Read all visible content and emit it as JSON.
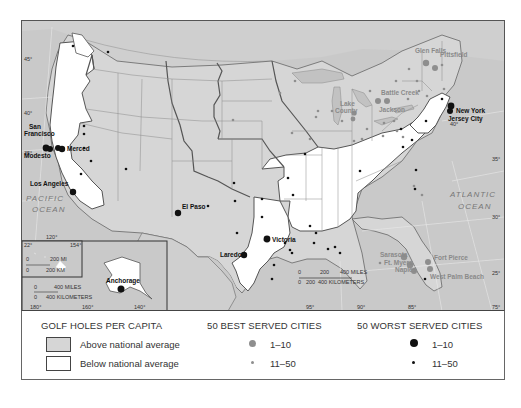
{
  "map": {
    "colors": {
      "above_average": "#d6d6d6",
      "below_average": "#ffffff",
      "water": "#c9c9c9",
      "best_dot": "#8e8e8e",
      "worst_dot": "#111111"
    },
    "oceans": {
      "pacific_line1": "PACIFIC",
      "pacific_line2": "OCEAN",
      "atlantic_line1": "ATLANTIC",
      "atlantic_line2": "OCEAN"
    },
    "latitude_ticks": [
      "45°",
      "40°",
      "35°",
      "30°",
      "25°"
    ],
    "east_latitude_ticks": [
      "40°",
      "35°",
      "30°",
      "25°"
    ],
    "longitude_ticks": [
      "95°",
      "90°",
      "85°",
      "75°"
    ],
    "inset_longitude_ticks": [
      "180°",
      "160°",
      "140°"
    ],
    "hawaii_ticks": [
      "22°",
      "154°",
      "120°"
    ],
    "scale_main": {
      "miles": [
        "0",
        "200",
        "400 MILES"
      ],
      "km": [
        "0",
        "200",
        "400 KILOMETERS"
      ]
    },
    "scale_hawaii": {
      "miles": [
        "0",
        "200 MI"
      ],
      "km": [
        "0",
        "200 KM"
      ]
    },
    "scale_alaska": {
      "miles": [
        "0",
        "400 MILES"
      ],
      "km": [
        "0",
        "400 KILOMETERS"
      ]
    },
    "cities_worst_top10": [
      {
        "name": "San Francisco",
        "line1": "San",
        "line2": "Francisco"
      },
      {
        "name": "Modesto"
      },
      {
        "name": "Merced"
      },
      {
        "name": "Los Angeles"
      },
      {
        "name": "El Paso"
      },
      {
        "name": "Laredo"
      },
      {
        "name": "Victoria"
      },
      {
        "name": "Anchorage"
      },
      {
        "name": "New York"
      },
      {
        "name": "Jersey City"
      }
    ],
    "cities_best_top10": [
      {
        "name": "Glen Falls"
      },
      {
        "name": "Pittsfield"
      },
      {
        "name": "Battle Creek"
      },
      {
        "name": "Lake County",
        "line1": "Lake",
        "line2": "County"
      },
      {
        "name": "Jackson"
      },
      {
        "name": "Sarasota"
      },
      {
        "name": "Ft. Myers"
      },
      {
        "name": "Naples"
      },
      {
        "name": "Fort Pierce"
      },
      {
        "name": "West Palm Beach"
      }
    ]
  },
  "legend": {
    "golf_heading": "GOLF HOLES PER CAPITA",
    "above_label": "Above national average",
    "below_label": "Below national average",
    "best_heading": "50 BEST SERVED CITIES",
    "best_rank_1": "1–10",
    "best_rank_2": "11–50",
    "worst_heading": "50 WORST SERVED CITIES",
    "worst_rank_1": "1–10",
    "worst_rank_2": "11–50"
  }
}
